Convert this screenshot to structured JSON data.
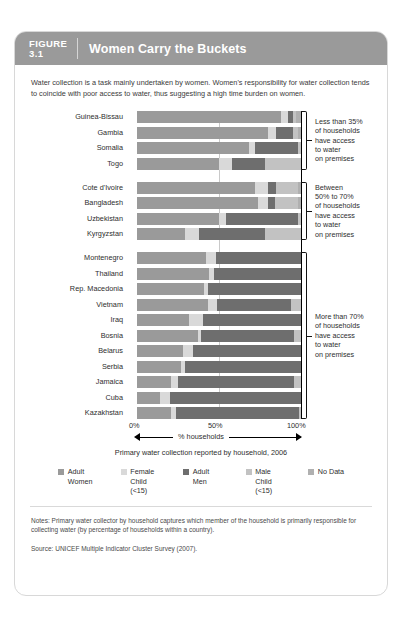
{
  "figure": {
    "number_label": "FIGURE",
    "number": "3.1",
    "title": "Women Carry the Buckets",
    "intro": "Water collection is a task mainly undertaken by women. Women's responsibility for water collection tends to coincide with poor access to water, thus suggesting a high time burden on women.",
    "notes": "Notes: Primary water collector by household captures which member of the household is primarily responsible for collecting water (by percentage of households within a country).",
    "source": "Source: UNICEF Multiple Indicator Cluster Survey (2007)."
  },
  "chart_data": {
    "type": "bar",
    "orientation": "horizontal",
    "stacked": true,
    "title": "Women Carry the Buckets",
    "subtitle": "Primary water collection reported by household, 2006",
    "xlabel": "% households",
    "ylabel": "",
    "xlim": [
      0,
      100
    ],
    "xticks": [
      0,
      50,
      100
    ],
    "xtick_labels": [
      "0%",
      "50%",
      "100%"
    ],
    "grid": "midline-at-50",
    "legend_position": "bottom",
    "series": [
      {
        "name": "Adult Women",
        "color": "#9a9a9a"
      },
      {
        "name": "Female Child (<15)",
        "color": "#d9d9d9"
      },
      {
        "name": "Adult Men",
        "color": "#6e6e6e"
      },
      {
        "name": "Male Child (<15)",
        "color": "#c2c2c2"
      },
      {
        "name": "No Data",
        "color": "#b0b0b0"
      }
    ],
    "categories": [
      "Guinea-Bissau",
      "Gambia",
      "Somalia",
      "Togo",
      "Cote d'Ivoire",
      "Bangladesh",
      "Uzbekistan",
      "Kyrgyzstan",
      "Montenegro",
      "Thailand",
      "Rep. Macedonia",
      "Vietnam",
      "Iraq",
      "Bosnia",
      "Belarus",
      "Serbia",
      "Jamaica",
      "Cuba",
      "Kazakhstan"
    ],
    "values": [
      [
        88,
        4,
        3,
        2,
        3
      ],
      [
        80,
        5,
        10,
        3,
        2
      ],
      [
        68,
        4,
        26,
        2,
        0
      ],
      [
        50,
        8,
        20,
        22,
        0
      ],
      [
        72,
        8,
        5,
        13,
        2
      ],
      [
        74,
        6,
        4,
        14,
        2
      ],
      [
        50,
        4,
        44,
        2,
        0
      ],
      [
        29,
        9,
        40,
        22,
        0
      ],
      [
        42,
        6,
        52,
        0,
        0
      ],
      [
        44,
        3,
        53,
        0,
        0
      ],
      [
        41,
        2,
        57,
        0,
        0
      ],
      [
        43,
        6,
        45,
        6,
        0
      ],
      [
        32,
        8,
        60,
        0,
        0
      ],
      [
        37,
        2,
        57,
        4,
        0
      ],
      [
        28,
        6,
        66,
        0,
        0
      ],
      [
        27,
        2,
        71,
        0,
        0
      ],
      [
        21,
        4,
        71,
        4,
        0
      ],
      [
        14,
        6,
        80,
        0,
        0
      ],
      [
        21,
        3,
        75,
        1,
        0
      ]
    ]
  },
  "groups": [
    {
      "id": "group-less-35",
      "start_index": 0,
      "end_index": 3,
      "note": "Less than 35% of households have access to water on premises",
      "note_lines": [
        "Less than 35%",
        "of households",
        "have access",
        "to water",
        "on premises"
      ]
    },
    {
      "id": "group-50-70",
      "start_index": 4,
      "end_index": 7,
      "note": "Between 50% to 70% of households have access to water on premises",
      "note_lines": [
        "Between",
        "50% to 70%",
        "of households",
        "have access",
        "to water",
        "on premises"
      ]
    },
    {
      "id": "group-more-70",
      "start_index": 8,
      "end_index": 18,
      "note": "More than 70% of households have access to water on premises",
      "note_lines": [
        "More than 70%",
        "of households",
        "have access",
        "to water",
        "on premises"
      ]
    }
  ],
  "legend": [
    {
      "label_line1": "Adult",
      "label_line2": "Women",
      "label_line3": "",
      "color": "#9a9a9a"
    },
    {
      "label_line1": "Female",
      "label_line2": "Child",
      "label_line3": "(<15)",
      "color": "#d9d9d9"
    },
    {
      "label_line1": "Adult",
      "label_line2": "Men",
      "label_line3": "",
      "color": "#6e6e6e"
    },
    {
      "label_line1": "Male",
      "label_line2": "Child",
      "label_line3": "(<15)",
      "color": "#c2c2c2"
    },
    {
      "label_line1": "No Data",
      "label_line2": "",
      "label_line3": "",
      "color": "#b0b0b0"
    }
  ],
  "axis": {
    "tick0": "0%",
    "tick50": "50%",
    "tick100": "100%",
    "title": "% households",
    "caption": "Primary water collection reported by household, 2006"
  }
}
